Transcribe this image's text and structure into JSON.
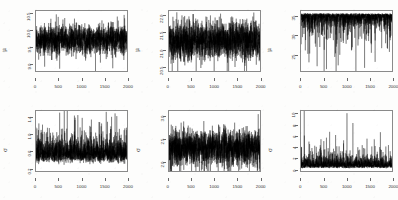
{
  "figure": {
    "type": "trace-plot-grid",
    "rows": 2,
    "columns": 3,
    "background_color": "#fdfdfc",
    "line_color": "#000000",
    "axis_color": "#8a8a8a",
    "panel_count": 6
  },
  "chart_data": [
    {
      "type": "line",
      "title": "",
      "xlabel": "",
      "ylabel": "μ",
      "xlim": [
        0,
        2000
      ],
      "ylim": [
        8.75,
        10.6
      ],
      "xticks": [
        0,
        500,
        1000,
        1500,
        2000
      ],
      "xtick_labels": [
        "0",
        "500",
        "1000",
        "1500",
        "2000"
      ],
      "yticks": [
        9.0,
        9.5,
        10.0,
        10.5
      ],
      "ytick_labels": [
        "9.0",
        "9.5",
        "10.0",
        "10.5"
      ],
      "grid": false,
      "legend": "none",
      "series": [
        {
          "name": "mu_1",
          "n": 2000,
          "mean": 9.72,
          "sd": 0.22,
          "min": 8.82,
          "max": 10.52,
          "description": "MCMC trace, stationary, one deep downward excursion near iteration 520"
        }
      ]
    },
    {
      "type": "line",
      "title": "",
      "xlabel": "",
      "ylabel": "μ",
      "xlim": [
        0,
        2000
      ],
      "ylim": [
        20.35,
        22.15
      ],
      "xticks": [
        0,
        500,
        1000,
        1500,
        2000
      ],
      "xtick_labels": [
        "0",
        "500",
        "1000",
        "1500",
        "2000"
      ],
      "yticks": [
        20.5,
        21.0,
        21.5,
        22.0
      ],
      "ytick_labels": [
        "20.5",
        "21.0",
        "21.5",
        "22.0"
      ],
      "grid": false,
      "legend": "none",
      "series": [
        {
          "name": "mu_2",
          "n": 2000,
          "mean": 21.25,
          "sd": 0.28,
          "min": 20.42,
          "max": 22.08,
          "description": "MCMC trace, stationary, dense band with downward spikes near 700 and 1450"
        }
      ]
    },
    {
      "type": "line",
      "title": "",
      "xlabel": "",
      "ylabel": "μ",
      "xlim": [
        0,
        2000
      ],
      "ylim": [
        20.5,
        36.5
      ],
      "xticks": [
        0,
        500,
        1000,
        1500,
        2000
      ],
      "xtick_labels": [
        "0",
        "500",
        "1000",
        "1500",
        "2000"
      ],
      "yticks": [
        25,
        30,
        35
      ],
      "ytick_labels": [
        "25",
        "30",
        "35"
      ],
      "grid": false,
      "legend": "none",
      "series": [
        {
          "name": "mu_3",
          "n": 2000,
          "mean": 33.2,
          "sd": 1.2,
          "min": 21.0,
          "max": 36.0,
          "description": "MCMC trace concentrated near upper bound with frequent deep downward spikes, deepest near iteration 560"
        }
      ]
    },
    {
      "type": "line",
      "title": "",
      "xlabel": "",
      "ylabel": "σ",
      "xlim": [
        0,
        2000
      ],
      "ylim": [
        0.12,
        1.56
      ],
      "xticks": [
        0,
        500,
        1000,
        1500,
        2000
      ],
      "xtick_labels": [
        "0",
        "500",
        "1000",
        "1500",
        "2000"
      ],
      "yticks": [
        0.2,
        0.6,
        1.0,
        1.4
      ],
      "ytick_labels": [
        "0.2",
        "0.6",
        "1.0",
        "1.4"
      ],
      "grid": false,
      "legend": "none",
      "series": [
        {
          "name": "sigma_1",
          "n": 2000,
          "mean": 0.45,
          "sd": 0.17,
          "min": 0.18,
          "max": 1.52,
          "description": "Right-skewed trace, dense low band with tall upward spikes, tallest near iteration 520"
        }
      ]
    },
    {
      "type": "line",
      "title": "",
      "xlabel": "",
      "ylabel": "σ",
      "xlim": [
        0,
        2000
      ],
      "ylim": [
        1.78,
        3.12
      ],
      "xticks": [
        0,
        500,
        1000,
        1500,
        2000
      ],
      "xtick_labels": [
        "0",
        "500",
        "1000",
        "1500",
        "2000"
      ],
      "yticks": [
        2.0,
        2.5,
        3.0
      ],
      "ytick_labels": [
        "2.0",
        "2.5",
        "3.0"
      ],
      "grid": false,
      "legend": "none",
      "series": [
        {
          "name": "sigma_2",
          "n": 2000,
          "mean": 2.3,
          "sd": 0.2,
          "min": 1.82,
          "max": 3.05,
          "description": "MCMC trace, stationary dense band with symmetric excursions"
        }
      ]
    },
    {
      "type": "line",
      "title": "",
      "xlabel": "",
      "ylabel": "σ",
      "xlim": [
        0,
        2000
      ],
      "ylim": [
        -0.4,
        10.6
      ],
      "xticks": [
        0,
        500,
        1000,
        1500,
        2000
      ],
      "xtick_labels": [
        "0",
        "500",
        "1000",
        "1500",
        "2000"
      ],
      "yticks": [
        0,
        2,
        4,
        6,
        8,
        10
      ],
      "ytick_labels": [
        "0",
        "2",
        "4",
        "6",
        "8",
        "10"
      ],
      "grid": false,
      "legend": "none",
      "series": [
        {
          "name": "sigma_3",
          "n": 2000,
          "mean": 1.5,
          "sd": 1.1,
          "min": 0.05,
          "max": 10.2,
          "description": "Strongly right-skewed trace hugging zero with sparse tall spikes, tallest near iteration 1010"
        }
      ]
    }
  ]
}
